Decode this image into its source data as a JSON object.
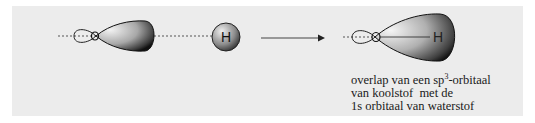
{
  "diagram": {
    "left_group": {
      "carbon_orbital": "sp3-orbitaal",
      "hydrogen_label": "H"
    },
    "arrow": "reaction-arrow",
    "right_group": {
      "hydrogen_label": "H"
    },
    "caption": {
      "line1_pre": "overlap van een sp",
      "line1_sup": "3",
      "line1_post": "-orbitaal",
      "line2": "van koolstof  met de",
      "line3": "1s orbitaal van waterstof"
    },
    "colors": {
      "background": "#ececec",
      "lobe_dark": "#1a1a1a",
      "lobe_light": "#e8e8e8"
    }
  }
}
